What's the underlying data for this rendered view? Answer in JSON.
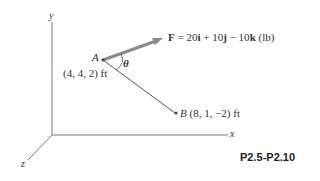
{
  "diagram": {
    "axes": {
      "x_label": "x",
      "y_label": "y",
      "z_label": "z"
    },
    "point_a": {
      "label": "A",
      "coords": "(4, 4, 2) ft"
    },
    "point_b": {
      "label": "B",
      "coords": "(8, 1, −2) ft"
    },
    "angle_label": "θ",
    "force": {
      "symbol": "F",
      "equals": " = 20",
      "i": "i",
      "plus1": " + 10",
      "j": "j",
      "minus": " − 10",
      "k": "k",
      "unit": " (lb)"
    },
    "figure_label": "P2.5-P2.10",
    "colors": {
      "axis": "#777777",
      "force_arrow": "#8a8a8a",
      "line_ab": "#555555",
      "text": "#333333"
    }
  }
}
